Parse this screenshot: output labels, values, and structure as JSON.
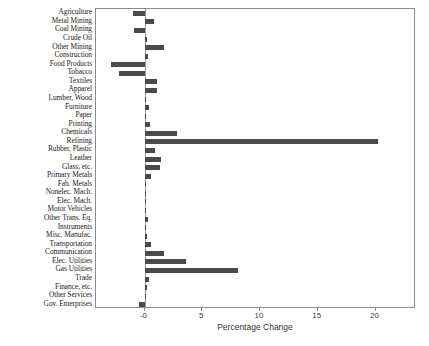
{
  "chart_data": {
    "type": "bar",
    "orientation": "horizontal",
    "title": "",
    "xlabel": "Percentage Change",
    "ylabel": "",
    "xlim": [
      -4.2,
      23.5
    ],
    "xticks": [
      0,
      5,
      10,
      15,
      20
    ],
    "xtick_labels": [
      "-0",
      "5",
      "10",
      "15",
      "20"
    ],
    "grid": false,
    "legend": null,
    "bar_color": "#4a4a4a",
    "axis_color": "#8a8a8a",
    "categories": [
      "Agriculture",
      "Metal Mining",
      "Coal Mining",
      "Crude Oil",
      "Other Mining",
      "Construction",
      "Food Products",
      "Tobacco",
      "Textiles",
      "Apparel",
      "Lumber, Wood",
      "Furniture",
      "Paper",
      "Printing",
      "Chemicals",
      "Refining",
      "Rubber, Plastic",
      "Leather",
      "Glass, etc.",
      "Primary Metals",
      "Fab. Metals",
      "Nonelec. Mach.",
      "Elec. Mach.",
      "Motor Vehicles",
      "Other Trans. Eq.",
      "Instruments",
      "Misc. Manufac.",
      "Transportation",
      "Communication",
      "Elec. Utilities",
      "Gas Utilities",
      "Trade",
      "Finance, etc.",
      "Other Services",
      "Gov. Enterprises"
    ],
    "values": [
      -1.0,
      0.8,
      -0.9,
      0.2,
      1.7,
      0.3,
      -2.9,
      -2.2,
      1.1,
      1.1,
      0.1,
      0.4,
      0.0,
      0.5,
      2.8,
      20.2,
      0.9,
      1.4,
      1.3,
      0.6,
      0.1,
      0.1,
      0.1,
      0.1,
      0.3,
      0.1,
      0.2,
      0.6,
      1.7,
      3.6,
      8.1,
      0.4,
      0.2,
      0.1,
      -0.5
    ]
  }
}
